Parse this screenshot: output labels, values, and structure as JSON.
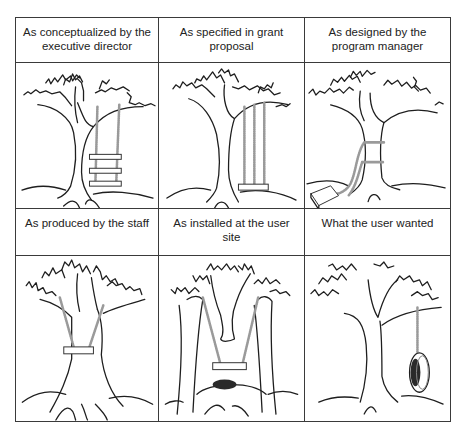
{
  "panels": [
    {
      "caption": "As conceptualized by the executive director",
      "drawing": "tree-with-three-tier-swing"
    },
    {
      "caption": "As specified in grant proposal",
      "drawing": "tree-with-three-rope-swing"
    },
    {
      "caption": "As designed by the program manager",
      "drawing": "tree-with-swing-wrapped-around-trunk"
    },
    {
      "caption": "As produced by the staff",
      "drawing": "tree-with-seat-around-trunk"
    },
    {
      "caption": "As installed at the user site",
      "drawing": "split-tree-with-swing-between-halves"
    },
    {
      "caption": "What the user wanted",
      "drawing": "tree-with-tire-swing"
    }
  ],
  "colors": {
    "ink": "#1e1e1e",
    "rope": "#9a9a9a",
    "border": "#3a3a3a",
    "background": "#ffffff"
  }
}
